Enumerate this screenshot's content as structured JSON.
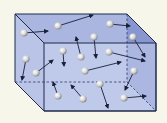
{
  "diagram": {
    "colors": {
      "background": "#f6f6ea",
      "box_face": "#b9c4e6",
      "box_side_right": "#8897cf",
      "box_top": "#aab6e0",
      "edge": "#1e2a4a",
      "hidden_edge": "#3a4a7a",
      "arrow": "#1a1f3a",
      "molecule": "#e6e6e6"
    },
    "box": {
      "back": {
        "tl": [
          15,
          14
        ],
        "tr": [
          127,
          14
        ],
        "br": [
          127,
          82
        ],
        "bl": [
          15,
          82
        ]
      },
      "front": {
        "tl": [
          44,
          43
        ],
        "tr": [
          156,
          43
        ],
        "br": [
          156,
          111
        ],
        "bl": [
          44,
          111
        ]
      }
    },
    "molecules": [
      {
        "x": 24,
        "y": 33,
        "to": [
          48,
          31
        ]
      },
      {
        "x": 58,
        "y": 26,
        "to": [
          93,
          15
        ]
      },
      {
        "x": 110,
        "y": 24,
        "to": [
          130,
          26
        ]
      },
      {
        "x": 133,
        "y": 37,
        "to": [
          145,
          57
        ]
      },
      {
        "x": 94,
        "y": 37,
        "to": [
          96,
          58
        ]
      },
      {
        "x": 81,
        "y": 57,
        "to": [
          76,
          37
        ]
      },
      {
        "x": 63,
        "y": 51,
        "to": [
          64,
          66
        ]
      },
      {
        "x": 109,
        "y": 52,
        "to": [
          145,
          61
        ]
      },
      {
        "x": 26,
        "y": 59,
        "to": [
          22,
          80
        ]
      },
      {
        "x": 36,
        "y": 73,
        "to": [
          53,
          60
        ]
      },
      {
        "x": 85,
        "y": 71,
        "to": [
          121,
          62
        ]
      },
      {
        "x": 134,
        "y": 71,
        "to": [
          125,
          90
        ]
      },
      {
        "x": 100,
        "y": 84,
        "to": [
          108,
          108
        ]
      },
      {
        "x": 58,
        "y": 96,
        "to": [
          53,
          82
        ]
      },
      {
        "x": 83,
        "y": 99,
        "to": [
          71,
          85
        ]
      },
      {
        "x": 124,
        "y": 98,
        "to": [
          146,
          96
        ]
      }
    ]
  }
}
